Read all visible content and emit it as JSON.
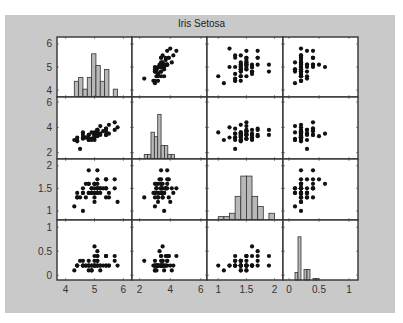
{
  "chart_data": {
    "type": "scatter",
    "subtype": "scatter-matrix",
    "title": "Iris Setosa",
    "variables": [
      "sepal_length",
      "sepal_width",
      "petal_length",
      "petal_width"
    ],
    "colors": {
      "panel_bg": "#c9c9c9",
      "plot_bg": "#ffffff",
      "bar_fill": "#b8b8b8",
      "marker": "#111111",
      "axis": "#333333"
    },
    "axes": [
      {
        "var": "sepal_length",
        "range": [
          3.7,
          6.3
        ],
        "ticks": [
          4,
          5,
          6
        ],
        "tick_labels": [
          "4",
          "5",
          "6"
        ]
      },
      {
        "var": "sepal_width",
        "range": [
          1.5,
          6.4
        ],
        "ticks": [
          2,
          4,
          6
        ],
        "tick_labels": [
          "2",
          "4",
          "6"
        ]
      },
      {
        "var": "petal_length",
        "range": [
          0.8,
          2.15
        ],
        "ticks": [
          1,
          1.5,
          2
        ],
        "tick_labels": [
          "1",
          "1.5",
          "2"
        ]
      },
      {
        "var": "petal_width",
        "range": [
          -0.1,
          1.15
        ],
        "ticks": [
          0,
          0.5,
          1
        ],
        "tick_labels": [
          "0",
          "0.5",
          "1"
        ]
      }
    ],
    "histograms": [
      {
        "var": "sepal_length",
        "bin_start": 4.3,
        "bin_width": 0.15,
        "counts": [
          4,
          5,
          2,
          5,
          11,
          8,
          4,
          7,
          0,
          2
        ]
      },
      {
        "var": "sepal_width",
        "bin_start": 2.3,
        "bin_width": 0.22,
        "counts": [
          1,
          1,
          6,
          5,
          10,
          3,
          3,
          1,
          1
        ]
      },
      {
        "var": "petal_length",
        "bin_start": 1.0,
        "bin_width": 0.1,
        "counts": [
          1,
          1,
          2,
          7,
          13,
          13,
          7,
          4,
          0,
          2
        ]
      },
      {
        "var": "petal_width",
        "bin_start": 0.1,
        "bin_width": 0.05,
        "counts": [
          5,
          29,
          0,
          7,
          7,
          0,
          1,
          1
        ]
      }
    ],
    "points": [
      [
        5.1,
        3.5,
        1.4,
        0.2
      ],
      [
        4.9,
        3.0,
        1.4,
        0.2
      ],
      [
        4.7,
        3.2,
        1.3,
        0.2
      ],
      [
        4.6,
        3.1,
        1.5,
        0.2
      ],
      [
        5.0,
        3.6,
        1.4,
        0.2
      ],
      [
        5.4,
        3.9,
        1.7,
        0.4
      ],
      [
        4.6,
        3.4,
        1.4,
        0.3
      ],
      [
        5.0,
        3.4,
        1.5,
        0.2
      ],
      [
        4.4,
        2.9,
        1.4,
        0.2
      ],
      [
        4.9,
        3.1,
        1.5,
        0.1
      ],
      [
        5.4,
        3.7,
        1.5,
        0.2
      ],
      [
        4.8,
        3.4,
        1.6,
        0.2
      ],
      [
        4.8,
        3.0,
        1.4,
        0.1
      ],
      [
        4.3,
        3.0,
        1.1,
        0.1
      ],
      [
        5.8,
        4.0,
        1.2,
        0.2
      ],
      [
        5.7,
        4.4,
        1.5,
        0.4
      ],
      [
        5.4,
        3.9,
        1.3,
        0.4
      ],
      [
        5.1,
        3.5,
        1.4,
        0.3
      ],
      [
        5.7,
        3.8,
        1.7,
        0.3
      ],
      [
        5.1,
        3.8,
        1.5,
        0.3
      ],
      [
        5.4,
        3.4,
        1.7,
        0.2
      ],
      [
        5.1,
        3.7,
        1.5,
        0.4
      ],
      [
        4.6,
        3.6,
        1.0,
        0.2
      ],
      [
        5.1,
        3.3,
        1.7,
        0.5
      ],
      [
        4.8,
        3.4,
        1.9,
        0.2
      ],
      [
        5.0,
        3.0,
        1.6,
        0.2
      ],
      [
        5.0,
        3.4,
        1.6,
        0.4
      ],
      [
        5.2,
        3.5,
        1.5,
        0.2
      ],
      [
        5.2,
        3.4,
        1.4,
        0.2
      ],
      [
        4.7,
        3.2,
        1.6,
        0.2
      ],
      [
        4.8,
        3.1,
        1.6,
        0.2
      ],
      [
        5.4,
        3.4,
        1.5,
        0.4
      ],
      [
        5.2,
        4.1,
        1.5,
        0.1
      ],
      [
        5.5,
        4.2,
        1.4,
        0.2
      ],
      [
        4.9,
        3.1,
        1.5,
        0.2
      ],
      [
        5.0,
        3.2,
        1.2,
        0.2
      ],
      [
        5.5,
        3.5,
        1.3,
        0.2
      ],
      [
        4.9,
        3.6,
        1.4,
        0.1
      ],
      [
        4.4,
        3.0,
        1.3,
        0.2
      ],
      [
        5.1,
        3.4,
        1.5,
        0.2
      ],
      [
        5.0,
        3.5,
        1.3,
        0.3
      ],
      [
        4.5,
        2.3,
        1.3,
        0.3
      ],
      [
        4.4,
        3.2,
        1.3,
        0.2
      ],
      [
        5.0,
        3.5,
        1.6,
        0.6
      ],
      [
        5.1,
        3.8,
        1.9,
        0.4
      ],
      [
        4.8,
        3.0,
        1.4,
        0.3
      ],
      [
        5.1,
        3.8,
        1.6,
        0.2
      ],
      [
        4.6,
        3.2,
        1.4,
        0.2
      ],
      [
        5.3,
        3.7,
        1.5,
        0.2
      ],
      [
        5.0,
        3.3,
        1.4,
        0.2
      ]
    ],
    "grid": false,
    "legend": null
  }
}
